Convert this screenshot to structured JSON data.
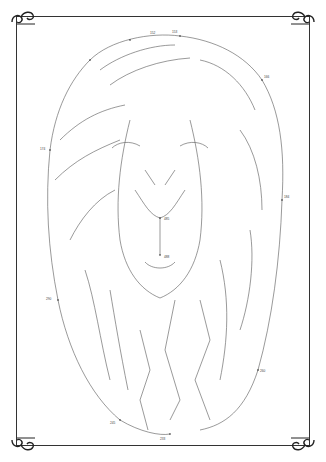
{
  "puzzle": {
    "type": "dot-to-dot",
    "subject": "lion head",
    "first_dot": "1",
    "sample_labels": [
      "149",
      "150",
      "152",
      "153",
      "154",
      "160",
      "161",
      "166",
      "168",
      "171",
      "174",
      "176",
      "178",
      "180",
      "181",
      "184",
      "228",
      "230",
      "231",
      "232",
      "233",
      "235",
      "236",
      "237",
      "238",
      "242",
      "245",
      "250",
      "252",
      "255",
      "258",
      "260",
      "272",
      "273",
      "274",
      "275",
      "276",
      "277",
      "280",
      "285",
      "290",
      "300",
      "320",
      "350",
      "380",
      "400",
      "420",
      "440",
      "470",
      "485",
      "488",
      "499",
      "505"
    ]
  },
  "frame": {
    "border_color": "#333333",
    "ornament_icon": "scroll-flourish-icon"
  }
}
